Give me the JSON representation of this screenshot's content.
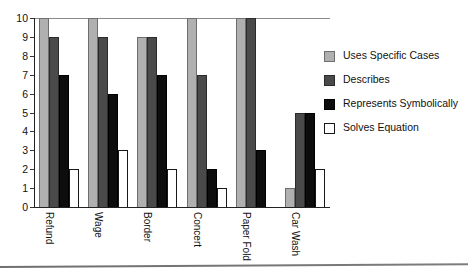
{
  "chart_data": {
    "type": "bar",
    "title": "",
    "xlabel": "",
    "ylabel": "",
    "ylim": [
      0,
      10
    ],
    "ytick_labels": [
      "10",
      "9",
      "8",
      "7",
      "6",
      "5",
      "4",
      "3",
      "2",
      "1",
      "0"
    ],
    "yticks": [
      10,
      9,
      8,
      7,
      6,
      5,
      4,
      3,
      2,
      1,
      0
    ],
    "grid": false,
    "legend_position": "right",
    "categories": [
      "Refund",
      "Wage",
      "Border",
      "Concert",
      "Paper Fold",
      "Car Wash"
    ],
    "series": [
      {
        "name": "Uses Specific Cases",
        "color": "#b0b0b0",
        "values": [
          10,
          10,
          9,
          10,
          10,
          1
        ]
      },
      {
        "name": "Describes",
        "color": "#4a4a4a",
        "values": [
          9,
          9,
          9,
          7,
          10,
          5
        ]
      },
      {
        "name": "Represents Symbolically",
        "color": "#0d0d0d",
        "values": [
          7,
          6,
          7,
          2,
          3,
          5
        ]
      },
      {
        "name": "Solves Equation",
        "color": "#ffffff",
        "values": [
          2,
          3,
          2,
          1,
          0,
          2
        ]
      }
    ]
  },
  "legend": {
    "items": [
      {
        "label": "Uses Specific Cases"
      },
      {
        "label": "Describes"
      },
      {
        "label": "Represents Symbolically"
      },
      {
        "label": "Solves Equation"
      }
    ]
  }
}
